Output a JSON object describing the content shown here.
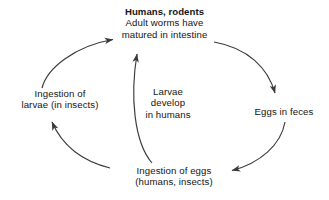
{
  "diagram": {
    "background_color": "#ffffff",
    "stroke_color": "#3a3a3a",
    "text_color": "#141414",
    "nodes": {
      "host": {
        "name": "humans-rodents-adult-worms",
        "lines": [
          "Humans, rodents",
          "Adult worms have",
          "matured in intestine"
        ],
        "emphasis": "first-line-bold"
      },
      "larvae_ingestion": {
        "name": "ingestion-of-larvae",
        "lines": [
          "Ingestion of",
          "larvae (in insects)"
        ]
      },
      "eggs_feces": {
        "name": "eggs-in-feces",
        "lines": [
          "Eggs in feces"
        ]
      },
      "eggs_ingestion": {
        "name": "ingestion-of-eggs",
        "lines": [
          "Ingestion of eggs",
          "(humans, insects)"
        ]
      },
      "larvae_develop": {
        "name": "larvae-develop-in-humans",
        "lines": [
          "Larvae",
          "develop",
          "in humans"
        ]
      }
    },
    "arrows": [
      {
        "name": "arrow-larvae-ingestion-to-host",
        "from": "larvae_ingestion",
        "to": "host",
        "direction": "up-right"
      },
      {
        "name": "arrow-host-to-eggs-feces",
        "from": "host",
        "to": "eggs_feces",
        "direction": "down-right"
      },
      {
        "name": "arrow-eggs-feces-to-eggs-ingestion",
        "from": "eggs_feces",
        "to": "eggs_ingestion",
        "direction": "down-left"
      },
      {
        "name": "arrow-eggs-ingestion-to-larvae-ingestion",
        "from": "eggs_ingestion",
        "to": "larvae_ingestion",
        "direction": "up-left"
      },
      {
        "name": "arrow-eggs-ingestion-to-host",
        "from": "eggs_ingestion",
        "to": "host",
        "direction": "up",
        "label": "larvae_develop"
      }
    ]
  }
}
